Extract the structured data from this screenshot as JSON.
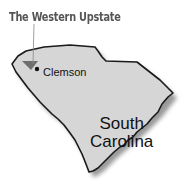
{
  "map": {
    "title": "The Western Upstate",
    "city": "Clemson",
    "state_line1": "South",
    "state_line2": "Carolina",
    "colors": {
      "state_fill": "#d6d6d6",
      "outline": "#1a1a1a",
      "shadow": "#7a7a7a",
      "region_marker": "#6e6e6e",
      "title_text": "#555555"
    }
  }
}
